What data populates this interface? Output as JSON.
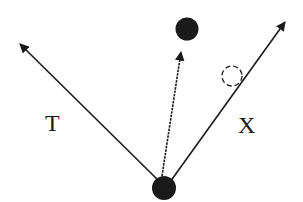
{
  "diagram": {
    "labels": {
      "left_vector": "T",
      "right_vector": "X"
    },
    "colors": {
      "ink": "#1a1a1a",
      "background": "#ffffff"
    },
    "nodes": [
      {
        "id": "origin",
        "cx": 164,
        "cy": 188,
        "r": 12,
        "style": "filled"
      },
      {
        "id": "top",
        "cx": 187,
        "cy": 29,
        "r": 12,
        "style": "filled"
      },
      {
        "id": "ghost",
        "cx": 232,
        "cy": 76,
        "r": 10,
        "style": "dashed-outline"
      }
    ],
    "arrows": [
      {
        "id": "T",
        "from": [
          160,
          182
        ],
        "to": [
          18,
          42
        ],
        "style": "solid"
      },
      {
        "id": "middle",
        "from": [
          162,
          176
        ],
        "to": [
          182,
          50
        ],
        "style": "dotted"
      },
      {
        "id": "X",
        "from": [
          170,
          182
        ],
        "to": [
          287,
          20
        ],
        "style": "solid"
      }
    ]
  }
}
